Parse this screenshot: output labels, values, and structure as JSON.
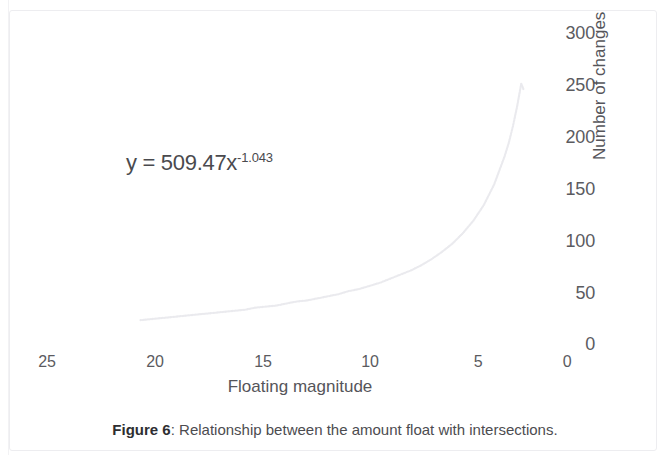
{
  "figure": {
    "caption_label": "Figure 6",
    "caption_separator": ": ",
    "caption_text": "Relationship between the amount float with intersections."
  },
  "annotation": {
    "equation_base": "y = 509.47x",
    "equation_exponent": "-1.043"
  },
  "axes": {
    "x_title": "Floating magnitude",
    "y_title": "Number of changes"
  },
  "chart_data": {
    "type": "scatter",
    "title": "",
    "subtitle": "",
    "xlabel": "Floating magnitude",
    "ylabel": "Number of changes",
    "xlim": [
      25,
      0
    ],
    "ylim": [
      0,
      300
    ],
    "x_inverted": true,
    "y_axis_position": "right",
    "grid": false,
    "legend": null,
    "xticks": [
      "25",
      "20",
      "15",
      "10",
      "5",
      "0"
    ],
    "xtick_values": [
      25,
      20,
      15,
      10,
      5,
      0
    ],
    "yticks": [
      "0",
      "50",
      "100",
      "150",
      "200",
      "250",
      "300"
    ],
    "ytick_values": [
      0,
      50,
      100,
      150,
      200,
      250,
      300
    ],
    "series": [
      {
        "name": "Number of changes vs floating magnitude",
        "marker": "dot",
        "color": "#eaeaee",
        "fit_equation": "y = 509.47x^-1.043",
        "fit_coefficient": 509.47,
        "fit_exponent": -1.043,
        "x": [
          20.5,
          20.0,
          19.5,
          19.0,
          18.5,
          18.0,
          17.5,
          17.0,
          16.5,
          16.0,
          15.5,
          15.0,
          14.5,
          14.0,
          13.5,
          13.0,
          12.5,
          12.0,
          11.5,
          11.0,
          10.5,
          10.0,
          9.5,
          9.0,
          8.5,
          8.0,
          7.5,
          7.0,
          6.5,
          6.0,
          5.5,
          5.0,
          4.5,
          4.0,
          3.5,
          3.0,
          2.8,
          2.6,
          2.4,
          2.3,
          2.2,
          2.1
        ],
        "y": [
          22,
          23,
          24,
          25,
          26,
          27,
          28,
          29,
          30,
          31,
          32,
          34,
          35,
          36,
          38,
          40,
          41,
          43,
          45,
          47,
          50,
          52,
          55,
          58,
          62,
          66,
          70,
          75,
          81,
          88,
          96,
          106,
          118,
          133,
          153,
          180,
          193,
          209,
          228,
          239,
          250,
          245
        ]
      }
    ]
  },
  "ticks": {
    "y": [
      {
        "label": "300",
        "top": 23,
        "left": 539
      },
      {
        "label": "250",
        "top": 75,
        "left": 539
      },
      {
        "label": "200",
        "top": 127,
        "left": 539
      },
      {
        "label": "150",
        "top": 179,
        "left": 539
      },
      {
        "label": "100",
        "top": 231,
        "left": 539
      },
      {
        "label": "50",
        "top": 283,
        "left": 539
      },
      {
        "label": "0",
        "top": 334,
        "left": 539
      }
    ],
    "x": [
      {
        "label": "25",
        "left": 25,
        "top": 353
      },
      {
        "label": "20",
        "left": 133,
        "top": 353
      },
      {
        "label": "15",
        "left": 241,
        "top": 353
      },
      {
        "label": "10",
        "left": 348,
        "top": 353
      },
      {
        "label": "5",
        "left": 456,
        "top": 353
      },
      {
        "label": "0",
        "left": 545,
        "top": 353
      }
    ]
  }
}
